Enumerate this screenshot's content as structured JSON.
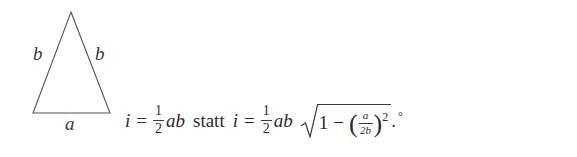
{
  "document": {
    "background_color": "#ffffff",
    "ink_color": "#2b2b2b"
  },
  "figure": {
    "name": "isosceles-triangle",
    "labels": {
      "left_side": "b",
      "right_side": "b",
      "base": "a"
    },
    "geometry": {
      "apex": [
        71,
        12
      ],
      "bottom_left": [
        33,
        113
      ],
      "bottom_right": [
        110,
        113
      ],
      "stroke_color": "#555555",
      "stroke_width": 1.1
    }
  },
  "equation": {
    "full_text": "i = 1/2 ab statt i = 1/2 ab √(1 − (a/2b)²).°",
    "lhs": {
      "variable": "i",
      "relation": "=",
      "fraction": {
        "numerator": "1",
        "denominator": "2"
      },
      "factors": "ab"
    },
    "connector": "statt",
    "rhs": {
      "variable": "i",
      "relation": "=",
      "fraction": {
        "numerator": "1",
        "denominator": "2"
      },
      "factors": "ab",
      "radicand": {
        "one": "1",
        "minus": "−",
        "open_paren": "(",
        "inner_fraction": {
          "numerator": "a",
          "denominator": "2b"
        },
        "close_paren": ")",
        "exponent": "2"
      }
    },
    "trailing_period": ".",
    "trailing_degree": "°"
  }
}
